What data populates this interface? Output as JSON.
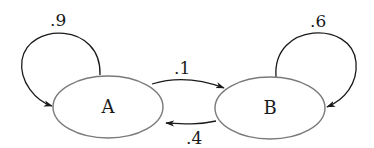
{
  "diagram": {
    "type": "markov-chain",
    "colors": {
      "node_stroke": "#7a7a7a",
      "edge": "#1a1a1a",
      "background": "#ffffff"
    },
    "nodes": [
      {
        "id": "A",
        "label": "A"
      },
      {
        "id": "B",
        "label": "B"
      }
    ],
    "edges": [
      {
        "from": "A",
        "to": "A",
        "label": ".9"
      },
      {
        "from": "A",
        "to": "B",
        "label": ".1"
      },
      {
        "from": "B",
        "to": "A",
        "label": ".4"
      },
      {
        "from": "B",
        "to": "B",
        "label": ".6"
      }
    ]
  }
}
